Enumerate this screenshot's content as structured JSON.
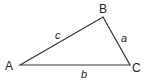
{
  "diagram": {
    "type": "triangle",
    "stroke_color": "#333333",
    "vertices": [
      {
        "label": "A",
        "x": 20,
        "y": 65
      },
      {
        "label": "B",
        "x": 103,
        "y": 17
      },
      {
        "label": "C",
        "x": 130,
        "y": 65
      }
    ],
    "sides": [
      {
        "label": "c",
        "from": "A",
        "to": "B"
      },
      {
        "label": "a",
        "from": "B",
        "to": "C"
      },
      {
        "label": "b",
        "from": "A",
        "to": "C"
      }
    ]
  }
}
